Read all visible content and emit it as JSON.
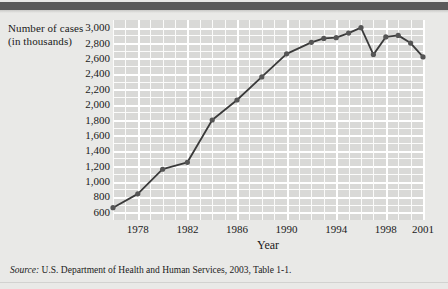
{
  "figure": {
    "y_axis_title": "Number of cases (in thousands)",
    "x_axis_title": "Year",
    "source_prefix": "Source:",
    "source_text": "U.S. Department of Health and Human Services, 2003, Table 1-1."
  },
  "colors": {
    "plot_background": "#d9d9d7",
    "gridline": "#ffffff",
    "series_line": "#3a3a3a",
    "marker": "#555555",
    "page_background": "#e9e9e7",
    "header_bar": "#5a5a5a"
  },
  "chart_data": {
    "type": "line",
    "title": "",
    "subtitle": "",
    "xlabel": "Year",
    "ylabel": "Number of cases (in thousands)",
    "xlim": [
      1976,
      2001
    ],
    "ylim": [
      500,
      3100
    ],
    "grid": true,
    "legend": "none",
    "ytick_labels": [
      "3,000",
      "2,800",
      "2,600",
      "2,400",
      "2,200",
      "2,000",
      "1,800",
      "1,600",
      "1,400",
      "1,200",
      "1,000",
      "800",
      "600"
    ],
    "ytick_values": [
      3000,
      2800,
      2600,
      2400,
      2200,
      2000,
      1800,
      1600,
      1400,
      1200,
      1000,
      800,
      600
    ],
    "xtick_labels": [
      "1978",
      "1982",
      "1986",
      "1990",
      "1994",
      "1998",
      "2001"
    ],
    "xtick_values": [
      1978,
      1982,
      1986,
      1990,
      1994,
      1998,
      2001
    ],
    "x": [
      1976,
      1978,
      1980,
      1982,
      1984,
      1986,
      1988,
      1990,
      1992,
      1993,
      1994,
      1995,
      1996,
      1997,
      1998,
      1999,
      2000,
      2001
    ],
    "values": [
      660,
      840,
      1160,
      1250,
      1800,
      2060,
      2360,
      2660,
      2810,
      2860,
      2870,
      2930,
      3000,
      2650,
      2880,
      2900,
      2800,
      2620
    ],
    "series": [
      {
        "name": "Number of cases",
        "values": [
          660,
          840,
          1160,
          1250,
          1800,
          2060,
          2360,
          2660,
          2810,
          2860,
          2870,
          2930,
          3000,
          2650,
          2880,
          2900,
          2800,
          2620
        ]
      }
    ]
  }
}
